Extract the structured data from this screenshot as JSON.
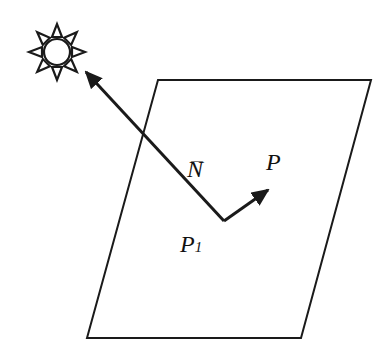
{
  "diagram": {
    "colors": {
      "stroke": "#1a1a1a",
      "background": "#ffffff"
    },
    "sun": {
      "icon": "sun-icon",
      "center": [
        57,
        52
      ],
      "radius": 14,
      "rays": 8
    },
    "plane": {
      "points": [
        [
          158,
          80
        ],
        [
          371,
          80
        ],
        [
          301,
          338
        ],
        [
          87,
          338
        ]
      ]
    },
    "normal_vector": {
      "from": [
        224,
        221
      ],
      "to": [
        86,
        72
      ]
    },
    "point_vector": {
      "from": [
        224,
        221
      ],
      "to": [
        268,
        190
      ]
    },
    "labels": {
      "normal": "N",
      "normal_accent": "⃗",
      "point": "P",
      "base_point": "P",
      "base_point_sub": "1"
    }
  }
}
